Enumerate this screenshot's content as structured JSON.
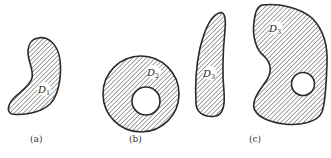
{
  "figure": {
    "panels": [
      {
        "id": "a",
        "caption": "(a)",
        "regions": [
          {
            "name": "D",
            "sub": "1"
          }
        ]
      },
      {
        "id": "b",
        "caption": "(b)",
        "regions": [
          {
            "name": "D",
            "sub": "2"
          }
        ]
      },
      {
        "id": "c",
        "caption": "(c)",
        "regions": [
          {
            "name": "D",
            "sub": "3"
          },
          {
            "name": "D",
            "sub": "3"
          }
        ]
      }
    ]
  },
  "colors": {
    "stroke": "#2a2a2a",
    "hatch": "#555555",
    "background": "#ffffff"
  }
}
